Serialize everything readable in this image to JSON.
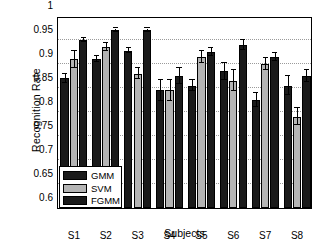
{
  "chart_data": {
    "type": "bar",
    "title": "",
    "xlabel": "Subjects",
    "ylabel": "Recognition Rate",
    "categories": [
      "S1",
      "S2",
      "S3",
      "S4",
      "S5",
      "S6",
      "S7",
      "S8"
    ],
    "ylim": [
      0.6,
      1
    ],
    "yticks": [
      "0.6",
      "0.65",
      "0.7",
      "0.75",
      "0.8",
      "0.85",
      "0.9",
      "0.95",
      "1"
    ],
    "ytick_values": [
      0.6,
      0.65,
      0.7,
      0.75,
      0.8,
      0.85,
      0.9,
      0.95,
      1
    ],
    "grid": true,
    "legend_position": "lower left",
    "series": [
      {
        "name": "GMM",
        "color": "#1a1a1a",
        "values": [
          0.87,
          0.91,
          0.928,
          0.845,
          0.855,
          0.885,
          0.825,
          0.855
        ],
        "errors": [
          0.01,
          0.006,
          0.006,
          0.022,
          0.012,
          0.018,
          0.015,
          0.02
        ]
      },
      {
        "name": "SVM",
        "color": "#b4b4b4",
        "values": [
          0.91,
          0.936,
          0.88,
          0.845,
          0.915,
          0.865,
          0.9,
          0.79
        ],
        "errors": [
          0.018,
          0.008,
          0.012,
          0.022,
          0.012,
          0.022,
          0.012,
          0.018
        ]
      },
      {
        "name": "FGMM",
        "color": "#1a1a1a",
        "values": [
          0.95,
          0.97,
          0.97,
          0.875,
          0.925,
          0.94,
          0.915,
          0.875
        ],
        "errors": [
          0.005,
          0.004,
          0.004,
          0.016,
          0.008,
          0.01,
          0.008,
          0.012
        ]
      }
    ]
  },
  "legend": {
    "items": [
      {
        "label": "GMM",
        "swatch": "gmm"
      },
      {
        "label": "SVM",
        "swatch": "svm"
      },
      {
        "label": "FGMM",
        "swatch": "fgmm"
      }
    ]
  }
}
